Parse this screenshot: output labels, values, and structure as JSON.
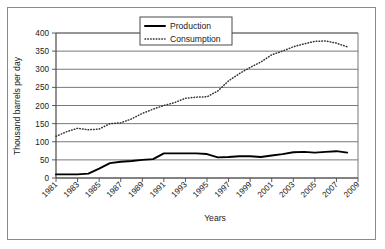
{
  "chart_data": {
    "type": "line",
    "title": "",
    "xlabel": "Years",
    "ylabel": "Thousand barrels per day",
    "xlim": [
      1981,
      2009
    ],
    "ylim": [
      0,
      400
    ],
    "ytick_labels": [
      "0",
      "50",
      "100",
      "150",
      "200",
      "250",
      "300",
      "350",
      "400"
    ],
    "ytick_values": [
      0,
      50,
      100,
      150,
      200,
      250,
      300,
      350,
      400
    ],
    "xtick_labels": [
      "1981",
      "1983",
      "1985",
      "1987",
      "1989",
      "1991",
      "1993",
      "1995",
      "1997",
      "1999",
      "2001",
      "2003",
      "2005",
      "2007",
      "2009"
    ],
    "xtick_values": [
      1981,
      1983,
      1985,
      1987,
      1989,
      1991,
      1993,
      1995,
      1997,
      1999,
      2001,
      2003,
      2005,
      2007,
      2009
    ],
    "grid": "horizontal",
    "legend_position": "top-center",
    "x": [
      1981,
      1982,
      1983,
      1984,
      1985,
      1986,
      1987,
      1988,
      1989,
      1990,
      1991,
      1992,
      1993,
      1994,
      1995,
      1996,
      1997,
      1998,
      1999,
      2000,
      2001,
      2002,
      2003,
      2004,
      2005,
      2006,
      2007,
      2008
    ],
    "series": [
      {
        "name": "Production",
        "style": "solid",
        "color": "#000000",
        "values": [
          10,
          10,
          10,
          12,
          26,
          41,
          45,
          47,
          50,
          52,
          68,
          68,
          68,
          68,
          66,
          57,
          58,
          60,
          60,
          58,
          62,
          66,
          71,
          72,
          70,
          72,
          74,
          70
        ]
      },
      {
        "name": "Consumption",
        "style": "dotted",
        "color": "#333333",
        "values": [
          115,
          128,
          137,
          133,
          135,
          150,
          152,
          163,
          178,
          190,
          200,
          208,
          220,
          223,
          224,
          240,
          268,
          288,
          305,
          320,
          340,
          350,
          362,
          370,
          377,
          378,
          372,
          362
        ]
      }
    ],
    "annotations": []
  },
  "legend": {
    "entries": [
      {
        "label": "Production",
        "style": "solid"
      },
      {
        "label": "Consumption",
        "style": "dotted"
      }
    ]
  },
  "axes": {
    "y_title": "Thousand barrels per day",
    "x_title": "Years"
  },
  "colors": {
    "axis": "#4a4a4a",
    "grid": "#6a6a6a",
    "frame": "#8a8a8a",
    "production": "#000000",
    "consumption": "#333333",
    "text": "#1a1a1a",
    "background": "#ffffff"
  }
}
